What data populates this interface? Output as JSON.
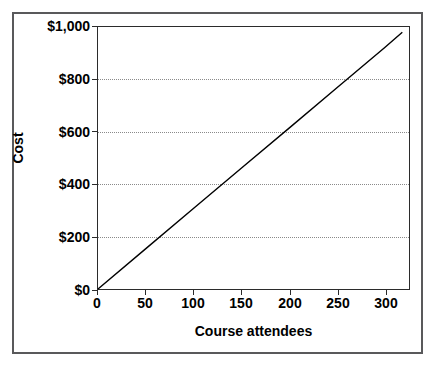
{
  "chart_data": {
    "type": "line",
    "title": "",
    "xlabel": "Course attendees",
    "ylabel": "Cost",
    "xlim": [
      0,
      325
    ],
    "ylim": [
      0,
      1000
    ],
    "grid": true,
    "legend": false,
    "x_ticks": [
      0,
      50,
      100,
      150,
      200,
      250,
      300
    ],
    "x_tick_labels": [
      "0",
      "50",
      "100",
      "150",
      "200",
      "250",
      "300"
    ],
    "y_ticks": [
      0,
      200,
      400,
      600,
      800,
      1000
    ],
    "y_tick_labels": [
      "$0",
      "$200",
      "$400",
      "$600",
      "$800",
      "$1,000"
    ],
    "series": [
      {
        "name": "Cost",
        "color": "#000000",
        "x": [
          0,
          50,
          100,
          150,
          200,
          250,
          300,
          318
        ],
        "values": [
          0,
          154,
          308,
          462,
          615,
          769,
          923,
          980
        ]
      }
    ]
  },
  "colors": {
    "outer_frame": "#59595b",
    "plot_border": "#2b2b2b",
    "gridline": "#8a8a8a",
    "series_line": "#000000",
    "background": "#ffffff"
  }
}
